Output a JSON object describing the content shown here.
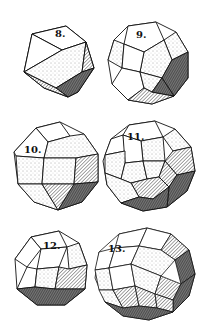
{
  "figure": {
    "colors": {
      "ink": "#111111",
      "paper": "#ffffff",
      "light_hatch": "#d9d9d9",
      "mid_hatch": "#a8a8a8",
      "dark_hatch": "#6e6e6e"
    },
    "solids": [
      {
        "number": "8.",
        "name": "cuboctahedron"
      },
      {
        "number": "9.",
        "name": "icosidodecahedron"
      },
      {
        "number": "10.",
        "name": "truncated-octahedron-rhombic"
      },
      {
        "number": "11.",
        "name": "rhombicosidodecahedron"
      },
      {
        "number": "12.",
        "name": "snub-cube"
      },
      {
        "number": "13.",
        "name": "snub-dodecahedron"
      }
    ]
  }
}
